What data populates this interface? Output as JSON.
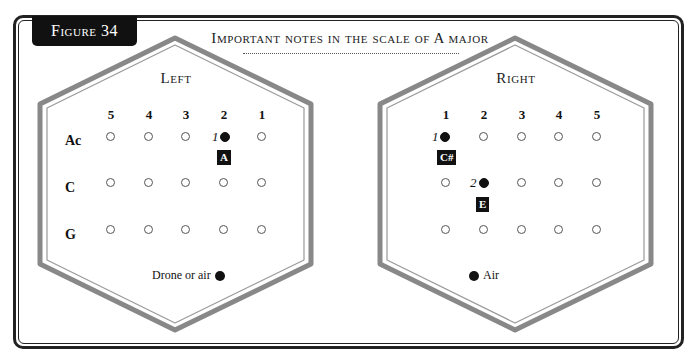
{
  "figure_label": "Figure 34",
  "title": "Important notes in the scale of A major",
  "panels": {
    "left": {
      "label": "Left",
      "columns": [
        "5",
        "4",
        "3",
        "2",
        "1"
      ],
      "rows": [
        "Ac",
        "C",
        "G"
      ],
      "legend": "Drone or air",
      "closed": [
        {
          "row": 0,
          "col": 3,
          "finger": "1",
          "note": "A"
        }
      ]
    },
    "right": {
      "label": "Right",
      "columns": [
        "1",
        "2",
        "3",
        "4",
        "5"
      ],
      "rows": [
        "",
        "",
        ""
      ],
      "legend": "Air",
      "closed": [
        {
          "row": 0,
          "col": 0,
          "finger": "1",
          "note": "C#"
        },
        {
          "row": 1,
          "col": 1,
          "finger": "2",
          "note": "E"
        }
      ]
    }
  }
}
